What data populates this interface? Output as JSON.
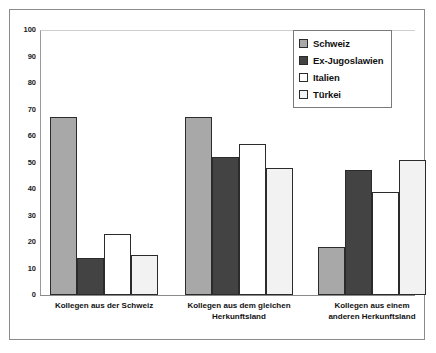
{
  "chart_data": {
    "type": "bar",
    "title": "",
    "subtitle": "",
    "xlabel": "",
    "ylabel": "",
    "ylim": [
      0,
      100
    ],
    "y_ticks": [
      0,
      10,
      20,
      30,
      40,
      50,
      60,
      70,
      80,
      90,
      100
    ],
    "grid": false,
    "legend_position": "top-right",
    "categories": [
      "Kollegen aus der Schweiz",
      "Kollegen aus dem gleichen Herkunftsland",
      "Kollegen aus einem anderen Herkunftsland"
    ],
    "category_lines": [
      [
        "Kollegen aus der Schweiz"
      ],
      [
        "Kollegen aus dem gleichen",
        "Herkunftsland"
      ],
      [
        "Kollegen aus einem",
        "anderen Herkunftsland"
      ]
    ],
    "series": [
      {
        "name": "Schweiz",
        "color": "#a8a8a8",
        "values": [
          67,
          67,
          18
        ]
      },
      {
        "name": "Ex-Jugoslawien",
        "color": "#434343",
        "values": [
          14,
          52,
          47
        ]
      },
      {
        "name": "Italien",
        "color": "#ffffff",
        "values": [
          23,
          57,
          39
        ]
      },
      {
        "name": "Türkei",
        "color": "#f2f2f2",
        "values": [
          15,
          48,
          51
        ]
      }
    ]
  },
  "legend": {
    "items": [
      {
        "label": "Schweiz",
        "color": "#a8a8a8"
      },
      {
        "label": "Ex-Jugoslawien",
        "color": "#434343"
      },
      {
        "label": "Italien",
        "color": "#ffffff"
      },
      {
        "label": "Türkei",
        "color": "#f2f2f2"
      }
    ]
  },
  "axis": {
    "y_tick_labels": [
      "100",
      "90",
      "80",
      "70",
      "60",
      "50",
      "40",
      "30",
      "20",
      "10",
      "0"
    ]
  }
}
